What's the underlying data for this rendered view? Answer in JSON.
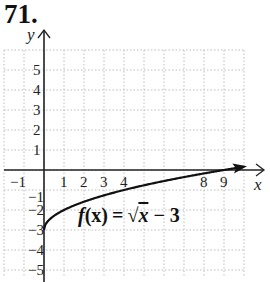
{
  "problem": {
    "number": "71."
  },
  "chart_data": {
    "type": "line",
    "title": "",
    "function_label": "f(x) = √x − 3",
    "function_parts": {
      "f": "f",
      "x_arg": "(x)",
      "eq": "=",
      "sqrt": "√",
      "rad": "x",
      "minus": "− 3"
    },
    "xlabel": "x",
    "ylabel": "y",
    "xlim": [
      -2,
      10
    ],
    "ylim": [
      -5.5,
      6
    ],
    "grid": true,
    "x_ticks": [
      "-1",
      "1",
      "2",
      "3",
      "4",
      "8",
      "9"
    ],
    "y_ticks": [
      "5",
      "4",
      "3",
      "2",
      "1",
      "-1",
      "-2",
      "-3",
      "-4",
      "-5"
    ],
    "series": [
      {
        "name": "f(x) = sqrt(x) - 3",
        "x": [
          0,
          0.25,
          1,
          2,
          3,
          4,
          5,
          6,
          7,
          8,
          9,
          10
        ],
        "y": [
          -3,
          -2.5,
          -2,
          -1.59,
          -1.27,
          -1,
          -0.76,
          -0.55,
          -0.35,
          -0.17,
          0,
          0.16
        ]
      }
    ],
    "annotations": [
      {
        "text": "f(x) = √x − 3",
        "x": 1.8,
        "y": -2.6
      }
    ]
  },
  "colors": {
    "axis": "#222222",
    "grid": "#b8b8b8",
    "curve": "#111111",
    "text": "#222222"
  }
}
